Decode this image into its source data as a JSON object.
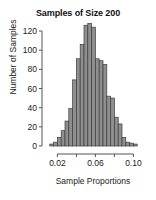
{
  "chart_data": {
    "type": "bar",
    "title": "Samples of Size 200",
    "xlabel": "Sample Proportions",
    "ylabel": "Number of Samples",
    "grid": false,
    "legend": null,
    "xlim": [
      0.008,
      0.108
    ],
    "ylim": [
      0,
      128
    ],
    "bin_width": 0.004,
    "xticks": [
      0.02,
      0.04,
      0.06,
      0.08,
      0.1
    ],
    "xtick_labels": [
      "0.02",
      "",
      "0.06",
      "",
      "0.10"
    ],
    "yticks": [
      0,
      20,
      40,
      60,
      80,
      100,
      120
    ],
    "ytick_labels": [
      "0",
      "20",
      "40",
      "60",
      "80",
      "100",
      "120"
    ],
    "categories": [
      0.014,
      0.018,
      0.022,
      0.026,
      0.03,
      0.034,
      0.038,
      0.042,
      0.046,
      0.05,
      0.054,
      0.058,
      0.062,
      0.066,
      0.07,
      0.074,
      0.078,
      0.082,
      0.086,
      0.09,
      0.094,
      0.098,
      0.102
    ],
    "values": [
      2,
      4,
      9,
      16,
      26,
      39,
      69,
      91,
      106,
      126,
      128,
      124,
      91,
      89,
      85,
      52,
      50,
      30,
      23,
      9,
      4,
      3,
      2
    ],
    "bar_fill": "#8f8f8f",
    "bar_stroke": "#3c3c3c",
    "axis_color": "#555555"
  }
}
